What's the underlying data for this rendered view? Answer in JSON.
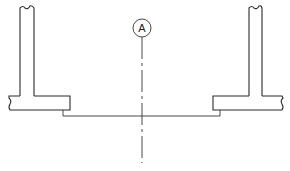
{
  "diagram": {
    "type": "section-drawing",
    "gridline": {
      "label": "A",
      "x": 142,
      "bubble_center_y": 28,
      "bubble_radius": 9,
      "line_top": 37,
      "line_bottom": 163
    },
    "left_element": {
      "name": "left-wall-footing",
      "wall": {
        "x1": 20,
        "x2": 34,
        "top": 7,
        "bottom": 96
      },
      "slab": {
        "x1": 9,
        "x2": 70,
        "top": 96,
        "bottom": 110
      },
      "step": {
        "x": 63,
        "bottom": 116
      }
    },
    "right_element": {
      "name": "right-wall-footing",
      "wall": {
        "x1": 249,
        "x2": 262,
        "top": 7,
        "bottom": 96
      },
      "slab": {
        "x1": 213,
        "x2": 282,
        "top": 96,
        "bottom": 110
      },
      "step": {
        "x": 220,
        "bottom": 116
      }
    },
    "base_line": {
      "y": 116,
      "x1": 63,
      "x2": 220
    },
    "colors": {
      "line": "#2a2a2a",
      "background": "#ffffff"
    }
  }
}
